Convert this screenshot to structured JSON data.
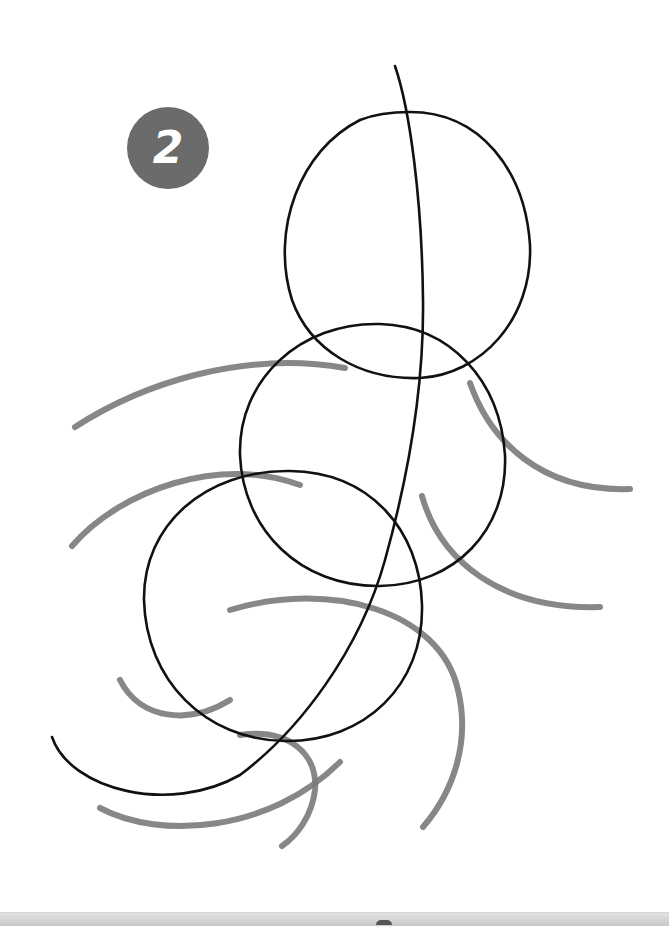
{
  "illustration": {
    "step_number": "2",
    "badge_color": "#6b6b6b",
    "ink_color": "#111111",
    "guide_color": "#7a7a7a",
    "subject": "sketch construction: three overlapping circles with a curved spine line and gray guide arcs"
  }
}
